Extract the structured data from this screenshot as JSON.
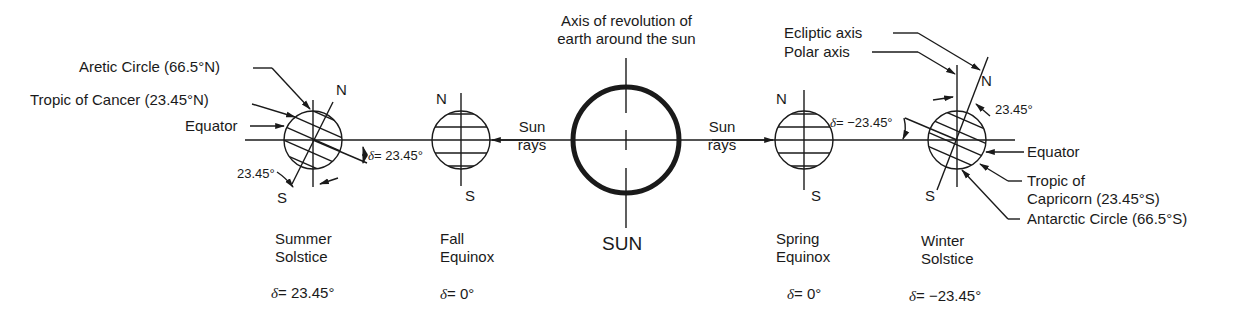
{
  "title": "Axis of revolution of earth around the sun",
  "top_label": {
    "line1": "Axis of revolution of",
    "line2": "earth around the sun"
  },
  "sun": {
    "label": "SUN"
  },
  "sun_rays": {
    "left": {
      "line1": "Sun",
      "line2": "rays"
    },
    "right": {
      "line1": "Sun",
      "line2": "rays"
    }
  },
  "positions": [
    {
      "name": "summer",
      "line1": "Summer",
      "line2": "Solstice",
      "delta_symbol": "δ",
      "delta_value": "= 23.45°",
      "north": "N",
      "south": "S"
    },
    {
      "name": "fall",
      "line1": "Fall",
      "line2": "Equinox",
      "delta_symbol": "δ",
      "delta_value": "= 0°",
      "north": "N",
      "south": "S"
    },
    {
      "name": "spring",
      "line1": "Spring",
      "line2": "Equinox",
      "delta_symbol": "δ",
      "delta_value": "= 0°",
      "north": "N",
      "south": "S"
    },
    {
      "name": "winter",
      "line1": "Winter",
      "line2": "Solstice",
      "delta_symbol": "δ",
      "delta_value": "= −23.45°",
      "north": "N",
      "south": "S"
    }
  ],
  "left_annotations": {
    "arctic": "Aretic Circle (66.5°N)",
    "cancer": "Tropic of  Cancer (23.45°N)",
    "equator": "Equator",
    "tilt": "23.45°",
    "delta_symbol": "δ",
    "delta_value": "= 23.45°"
  },
  "right_annotations": {
    "ecliptic": "Ecliptic axis",
    "polar": "Polar axis",
    "tilt": "23.45°",
    "delta_symbol": "δ",
    "delta_value": "= −23.45°",
    "equator": "Equator",
    "capricorn_line1": "Tropic of",
    "capricorn_line2": "Capricorn (23.45°S)",
    "antarctic": "Antarctic Circle (66.5°S)"
  },
  "colors": {
    "ink": "#1a1a1a",
    "background": "#ffffff"
  }
}
